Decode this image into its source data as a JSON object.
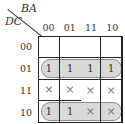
{
  "kmap": {
    "col_axis_label": "BA",
    "row_axis_label": "DC",
    "col_labels": [
      "00",
      "01",
      "11",
      "10"
    ],
    "row_labels": [
      "00",
      "01",
      "11",
      "10"
    ],
    "cells": [
      [
        "",
        "",
        "",
        ""
      ],
      [
        "1",
        "1",
        "1",
        "1"
      ],
      [
        "×",
        "×",
        "×",
        "×"
      ],
      [
        "1",
        "1",
        "×",
        "×"
      ]
    ],
    "groups": [
      {
        "name": "group-row-01",
        "covers": "row 01, all columns"
      },
      {
        "name": "group-row-10",
        "covers": "row 10, all columns"
      }
    ],
    "colors": {
      "group_fill": "#d9d9d9",
      "group_border": "#8c8c8c",
      "grid_line": "#222222",
      "text": "#333333",
      "dontcare": "#777777"
    }
  }
}
